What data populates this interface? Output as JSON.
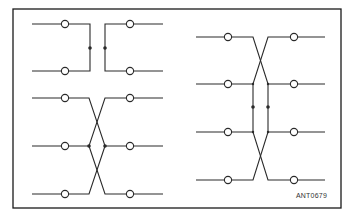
{
  "figure": {
    "id_label": "ANT0679",
    "colors": {
      "line": "#2a2a2a",
      "frame": "#1a1a1a",
      "background": "#ffffff",
      "terminal_fill": "#ffffff"
    }
  },
  "groups": [
    {
      "name": "parallel-pair",
      "description": "Two lines bridged by vertical links with junction dots",
      "rows": 2
    },
    {
      "name": "three-line-crossover",
      "description": "Three lines with crossing connections and junction dots on middle line",
      "rows": 3
    },
    {
      "name": "four-line-crossover",
      "description": "Four lines with crossings between outer pairs and vertical links with junction dots",
      "rows": 4
    }
  ]
}
